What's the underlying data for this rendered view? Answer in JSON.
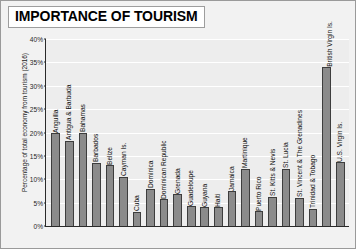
{
  "chart_data": {
    "type": "bar",
    "title": "IMPORTANCE OF TOURISM",
    "xlabel": "",
    "ylabel": "Percentage of total economy from tourism (2016)",
    "ylim": [
      0,
      40
    ],
    "ytick_labels": [
      "40%",
      "35%",
      "30%",
      "25%",
      "20%",
      "15%",
      "10%",
      "5%",
      "0%"
    ],
    "ytick_values": [
      40,
      35,
      30,
      25,
      20,
      15,
      10,
      5,
      0
    ],
    "grid": true,
    "legend": "none",
    "categories": [
      "Anguilla",
      "Antigua & Barbuda",
      "Bahamas",
      "Barbados",
      "Belize",
      "Cayman Is.",
      "Cuba",
      "Dominica",
      "Dominican Republic",
      "Grenada",
      "Guadeloupe",
      "Guyana",
      "Haiti",
      "Jamaica",
      "Martinique",
      "Puerto Rico",
      "St. Kitts & Nevis",
      "St. Lucia",
      "St. Vincent & The Grenadines",
      "Trinidad & Tobago",
      "British Virgin Is.",
      "U.S. Virgin Is."
    ],
    "values": [
      19.8,
      18.2,
      20.0,
      13.5,
      13.0,
      10.5,
      3.0,
      8.0,
      5.7,
      6.8,
      4.2,
      4.0,
      4.0,
      7.4,
      12.2,
      3.2,
      6.3,
      12.2,
      6.0,
      3.7,
      34.0,
      13.6
    ],
    "bar_color": "#8b8b8b",
    "bar_edge_color": "#3d3d3d",
    "plot_bg_color": "#ededed",
    "figure_bg_color": "#f2f2f2"
  }
}
